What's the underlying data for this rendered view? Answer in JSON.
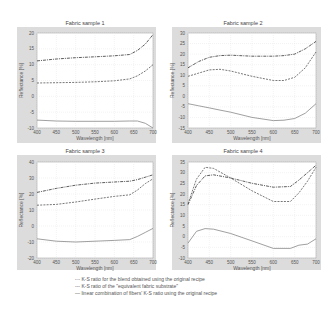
{
  "figure": {
    "legend": [
      {
        "style": "dashdot",
        "marker": "-·-",
        "label": "K-S ratio for the blend obtained using the original recipe"
      },
      {
        "style": "dashed",
        "marker": "---",
        "label": "K-S ratio of the \"equivalent fabric substrate\""
      },
      {
        "style": "solid",
        "marker": "—",
        "label": "linear combination of fibers' K-S ratio using the original recipe"
      }
    ]
  },
  "chart_data": [
    {
      "type": "line",
      "title": "Fabric sample 1",
      "xlabel": "Wavelength [nm]",
      "ylabel": "Reflectance [%]",
      "xlim": [
        400,
        700
      ],
      "ylim": [
        -10,
        20
      ],
      "xticks": [
        400,
        450,
        500,
        550,
        600,
        650,
        700
      ],
      "yticks": [
        -10,
        -5,
        0,
        5,
        10,
        15,
        20
      ],
      "grid": true,
      "x": [
        400,
        450,
        500,
        550,
        600,
        640,
        660,
        680,
        700
      ],
      "series": [
        {
          "name": "blend",
          "style": "dashdot",
          "values": [
            11.2,
            11.8,
            12.2,
            12.5,
            12.8,
            13.2,
            14.5,
            16.5,
            19.5
          ]
        },
        {
          "name": "equivalent",
          "style": "dashed",
          "values": [
            4.2,
            4.3,
            4.4,
            4.6,
            4.9,
            5.5,
            6.5,
            8.0,
            10.0
          ]
        },
        {
          "name": "linear",
          "style": "solid",
          "values": [
            -7.5,
            -7.8,
            -7.9,
            -7.9,
            -7.9,
            -7.8,
            -7.8,
            -8.5,
            -10
          ]
        }
      ]
    },
    {
      "type": "line",
      "title": "Fabric sample 2",
      "xlabel": "Wavelength [nm]",
      "ylabel": "Reflectance [%]",
      "xlim": [
        400,
        700
      ],
      "ylim": [
        -15,
        30
      ],
      "xticks": [
        400,
        450,
        500,
        550,
        600,
        650,
        700
      ],
      "yticks": [
        -15,
        -10,
        -5,
        0,
        5,
        10,
        15,
        20,
        25,
        30
      ],
      "grid": true,
      "x": [
        400,
        425,
        450,
        475,
        500,
        550,
        600,
        625,
        650,
        675,
        700
      ],
      "series": [
        {
          "name": "blend",
          "style": "dashdot",
          "values": [
            13.5,
            16.5,
            18.5,
            19.3,
            19.5,
            19.0,
            19.0,
            19.3,
            20.0,
            22.5,
            26.0
          ]
        },
        {
          "name": "equivalent",
          "style": "dashed",
          "values": [
            9.5,
            11.0,
            12.5,
            12.8,
            12.0,
            9.5,
            7.5,
            7.5,
            9.0,
            13.5,
            21.0
          ]
        },
        {
          "name": "linear",
          "style": "solid",
          "values": [
            -3.5,
            -4.5,
            -5.5,
            -6.5,
            -7.5,
            -10.0,
            -11.5,
            -11.3,
            -10.5,
            -8.0,
            -3.5
          ]
        }
      ]
    },
    {
      "type": "line",
      "title": "Fabric sample 3",
      "xlabel": "Wavelength [nm]",
      "ylabel": "Reflectance [%]",
      "xlim": [
        400,
        700
      ],
      "ylim": [
        -20,
        40
      ],
      "xticks": [
        400,
        450,
        500,
        550,
        600,
        650,
        700
      ],
      "yticks": [
        -20,
        -10,
        0,
        10,
        20,
        30,
        40
      ],
      "grid": true,
      "x": [
        400,
        450,
        500,
        550,
        600,
        640,
        660,
        680,
        700
      ],
      "series": [
        {
          "name": "blend",
          "style": "dashdot",
          "values": [
            21.0,
            23.5,
            25.5,
            26.8,
            27.5,
            28.0,
            29.0,
            30.5,
            32.0
          ]
        },
        {
          "name": "equivalent",
          "style": "dashed",
          "values": [
            13.0,
            13.5,
            15.0,
            16.8,
            18.5,
            19.5,
            22.5,
            26.5,
            29.5
          ]
        },
        {
          "name": "linear",
          "style": "solid",
          "values": [
            -8.0,
            -9.5,
            -10.0,
            -9.5,
            -9.0,
            -8.5,
            -6.5,
            -4.0,
            -1.5
          ]
        }
      ]
    },
    {
      "type": "line",
      "title": "Fabric sample 4",
      "xlabel": "Wavelength [nm]",
      "ylabel": "Reflectance [%]",
      "xlim": [
        400,
        700
      ],
      "ylim": [
        -10,
        35
      ],
      "xticks": [
        400,
        450,
        500,
        550,
        600,
        650,
        700
      ],
      "yticks": [
        -10,
        -5,
        0,
        5,
        10,
        15,
        20,
        25,
        30,
        35
      ],
      "grid": true,
      "x": [
        400,
        420,
        440,
        460,
        500,
        550,
        600,
        640,
        660,
        680,
        700
      ],
      "series": [
        {
          "name": "blend",
          "style": "dashdot",
          "values": [
            15.0,
            24.0,
            28.5,
            29.0,
            27.5,
            25.0,
            23.2,
            23.5,
            26.5,
            30.0,
            33.5
          ]
        },
        {
          "name": "equivalent",
          "style": "dashed",
          "values": [
            15.5,
            27.0,
            32.5,
            32.0,
            27.5,
            21.5,
            16.5,
            16.5,
            20.5,
            26.0,
            32.5
          ]
        },
        {
          "name": "linear",
          "style": "solid",
          "values": [
            -3.0,
            2.5,
            3.8,
            3.5,
            1.5,
            -2.0,
            -5.5,
            -5.5,
            -4.0,
            -3.5,
            -1.0
          ]
        }
      ]
    }
  ]
}
